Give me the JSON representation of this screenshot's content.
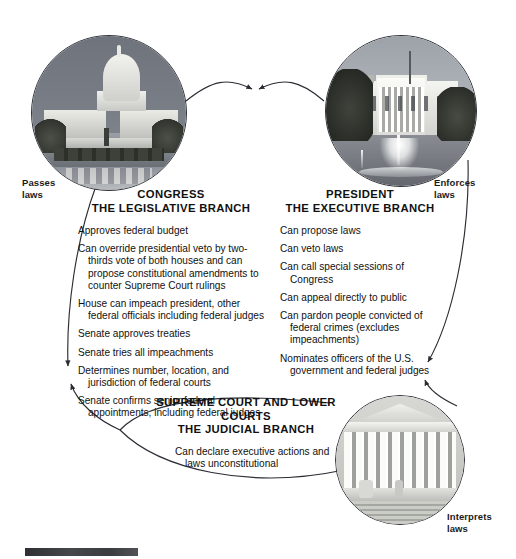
{
  "diagram": {
    "type": "cycle-diagram",
    "background_color": "#ffffff",
    "line_color": "#2b2d33"
  },
  "edge_labels": {
    "passes": "Passes\nlaws",
    "passes_line1": "Passes",
    "passes_line2": "laws",
    "enforces_line1": "Enforces",
    "enforces_line2": "laws",
    "interprets_line1": "Interprets",
    "interprets_line2": "laws"
  },
  "branches": {
    "legislative": {
      "name": "CONGRESS",
      "subtitle": "THE LEGISLATIVE BRANCH",
      "photo": "us-capitol-photo",
      "powers": [
        "Approves federal budget",
        "Can override presidential veto by two-thirds vote of both houses and can propose constitutional amendments to counter Supreme Court rulings",
        "House can impeach president, other federal officials including federal judges",
        "Senate approves treaties",
        "Senate tries all impeachments",
        "Determines number, location, and jurisdiction of federal courts",
        "Senate confirms senior federal appointments, including federal judges"
      ]
    },
    "executive": {
      "name": "PRESIDENT",
      "subtitle": "THE EXECUTIVE BRANCH",
      "photo": "white-house-photo",
      "powers": [
        "Can propose laws",
        "Can veto laws",
        "Can call special sessions of Congress",
        "Can appeal directly to public",
        "Can pardon people convicted of federal crimes (excludes impeachments)",
        "Nominates officers of the U.S. government and federal judges"
      ]
    },
    "judicial": {
      "name": "SUPREME COURT AND LOWER COURTS",
      "subtitle": "THE JUDICIAL BRANCH",
      "photo": "supreme-court-photo",
      "powers": [
        "Can declare executive actions and laws unconstitutional"
      ]
    }
  }
}
